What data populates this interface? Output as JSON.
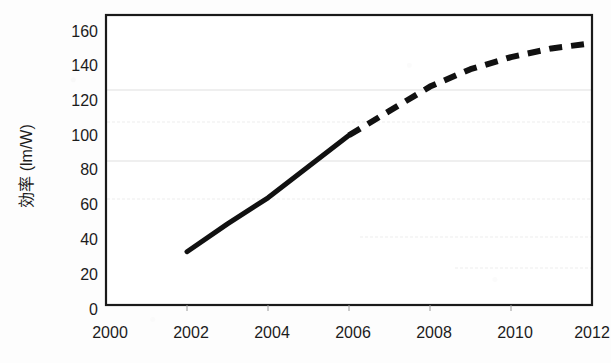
{
  "chart_data": {
    "type": "line",
    "title": "",
    "subtitle": "",
    "xlabel": "",
    "ylabel": "効率 (lm/W)",
    "xlim": [
      2000,
      2012
    ],
    "ylim": [
      0,
      160
    ],
    "x_ticks": [
      "2000",
      "2002",
      "2004",
      "2006",
      "2008",
      "2010",
      "2012"
    ],
    "y_ticks": [
      "0",
      "20",
      "40",
      "60",
      "80",
      "100",
      "120",
      "140",
      "160"
    ],
    "grid": "horizontal-faint",
    "legend_position": "none",
    "series": [
      {
        "name": "実績",
        "style": "solid",
        "color": "#111111",
        "x": [
          2002,
          2003,
          2004,
          2005,
          2006
        ],
        "values": [
          33,
          49,
          64,
          82,
          100
        ]
      },
      {
        "name": "予測",
        "style": "dashed",
        "color": "#111111",
        "x": [
          2006,
          2007,
          2008,
          2009,
          2010,
          2011,
          2012
        ],
        "values": [
          100,
          114,
          128,
          138,
          145,
          150,
          153
        ]
      }
    ],
    "annotations": []
  },
  "axis": {
    "y_title": "効率 (lm/W)",
    "x_title": ""
  }
}
